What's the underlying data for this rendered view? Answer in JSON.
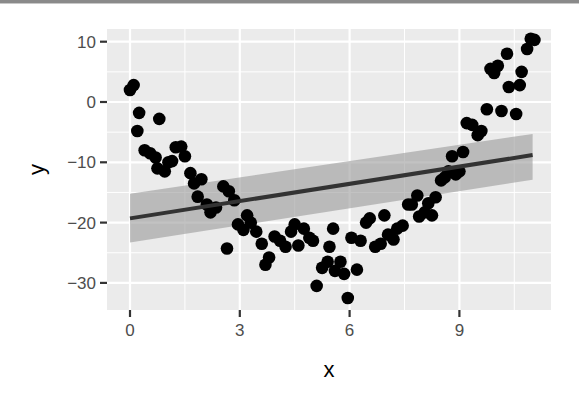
{
  "chart_data": {
    "type": "scatter",
    "title": "",
    "xlabel": "x",
    "ylabel": "y",
    "xlim": [
      -0.6,
      11.3
    ],
    "ylim": [
      -34.5,
      12.2
    ],
    "x_ticks": [
      0,
      3,
      6,
      9
    ],
    "x_tick_labels": [
      "0",
      "3",
      "6",
      "9"
    ],
    "y_ticks": [
      10,
      0,
      -10,
      -20,
      -30
    ],
    "y_tick_labels": [
      "10",
      "0",
      "−10",
      "−20",
      "−30"
    ],
    "grid": true,
    "legend": "none",
    "colors": {
      "panel_bg": "#ebebeb",
      "grid_major": "#ffffff",
      "points": "#000000",
      "smooth_line": "#3a3a3a",
      "confidence_band": "#999999"
    },
    "series": [
      {
        "name": "points",
        "type": "scatter",
        "points": [
          [
            0.0,
            2.0
          ],
          [
            0.1,
            2.8
          ],
          [
            0.25,
            -1.8
          ],
          [
            0.2,
            -4.8
          ],
          [
            0.4,
            -8.0
          ],
          [
            0.55,
            -8.5
          ],
          [
            0.7,
            -9.2
          ],
          [
            0.75,
            -11.0
          ],
          [
            0.8,
            -2.8
          ],
          [
            0.95,
            -11.5
          ],
          [
            1.05,
            -10.0
          ],
          [
            1.15,
            -9.8
          ],
          [
            1.25,
            -7.5
          ],
          [
            1.4,
            -7.4
          ],
          [
            1.5,
            -9.0
          ],
          [
            1.65,
            -11.8
          ],
          [
            1.75,
            -13.5
          ],
          [
            1.95,
            -12.8
          ],
          [
            1.85,
            -15.7
          ],
          [
            2.1,
            -17.0
          ],
          [
            2.2,
            -18.3
          ],
          [
            2.35,
            -17.5
          ],
          [
            2.55,
            -14.0
          ],
          [
            2.7,
            -14.8
          ],
          [
            2.65,
            -24.3
          ],
          [
            2.85,
            -16.3
          ],
          [
            2.95,
            -20.3
          ],
          [
            3.1,
            -21.2
          ],
          [
            3.2,
            -18.8
          ],
          [
            3.3,
            -20.0
          ],
          [
            3.45,
            -21.5
          ],
          [
            3.6,
            -23.5
          ],
          [
            3.7,
            -27.0
          ],
          [
            3.8,
            -25.8
          ],
          [
            3.95,
            -22.3
          ],
          [
            4.1,
            -23.0
          ],
          [
            4.25,
            -24.0
          ],
          [
            4.4,
            -21.5
          ],
          [
            4.5,
            -20.3
          ],
          [
            4.6,
            -23.8
          ],
          [
            4.75,
            -21.0
          ],
          [
            4.9,
            -22.5
          ],
          [
            5.0,
            -23.0
          ],
          [
            5.1,
            -30.5
          ],
          [
            5.25,
            -27.5
          ],
          [
            5.4,
            -26.5
          ],
          [
            5.45,
            -24.0
          ],
          [
            5.55,
            -21.0
          ],
          [
            5.6,
            -28.0
          ],
          [
            5.75,
            -26.5
          ],
          [
            5.85,
            -28.5
          ],
          [
            5.95,
            -32.5
          ],
          [
            6.05,
            -22.5
          ],
          [
            6.2,
            -27.8
          ],
          [
            6.3,
            -23.0
          ],
          [
            6.45,
            -20.0
          ],
          [
            6.55,
            -19.3
          ],
          [
            6.7,
            -24.0
          ],
          [
            6.85,
            -23.5
          ],
          [
            6.95,
            -18.8
          ],
          [
            7.05,
            -22.0
          ],
          [
            7.2,
            -22.8
          ],
          [
            7.3,
            -21.0
          ],
          [
            7.45,
            -20.5
          ],
          [
            7.6,
            -17.0
          ],
          [
            7.7,
            -17.0
          ],
          [
            7.85,
            -15.5
          ],
          [
            7.9,
            -19.0
          ],
          [
            8.05,
            -18.3
          ],
          [
            8.15,
            -16.8
          ],
          [
            8.25,
            -18.8
          ],
          [
            8.35,
            -15.8
          ],
          [
            8.5,
            -13.0
          ],
          [
            8.6,
            -12.5
          ],
          [
            8.7,
            -11.5
          ],
          [
            8.8,
            -9.0
          ],
          [
            8.9,
            -12.0
          ],
          [
            9.0,
            -11.5
          ],
          [
            9.1,
            -8.3
          ],
          [
            9.2,
            -3.5
          ],
          [
            9.35,
            -3.8
          ],
          [
            9.5,
            -5.5
          ],
          [
            9.6,
            -4.8
          ],
          [
            9.75,
            -1.2
          ],
          [
            9.85,
            5.5
          ],
          [
            9.95,
            4.8
          ],
          [
            10.05,
            6.0
          ],
          [
            10.15,
            -1.5
          ],
          [
            10.3,
            8.0
          ],
          [
            10.35,
            2.5
          ],
          [
            10.55,
            -2.0
          ],
          [
            10.65,
            2.8
          ],
          [
            10.7,
            5.0
          ],
          [
            10.85,
            8.8
          ],
          [
            10.95,
            10.5
          ],
          [
            11.05,
            10.3
          ]
        ]
      },
      {
        "name": "linear fit",
        "type": "line",
        "method": "lm",
        "x": [
          0.0,
          11.0
        ],
        "y": [
          -19.3,
          -8.8
        ],
        "ci_upper": [
          -15.2,
          -5.3
        ],
        "ci_lower": [
          -23.3,
          -12.9
        ]
      }
    ]
  }
}
